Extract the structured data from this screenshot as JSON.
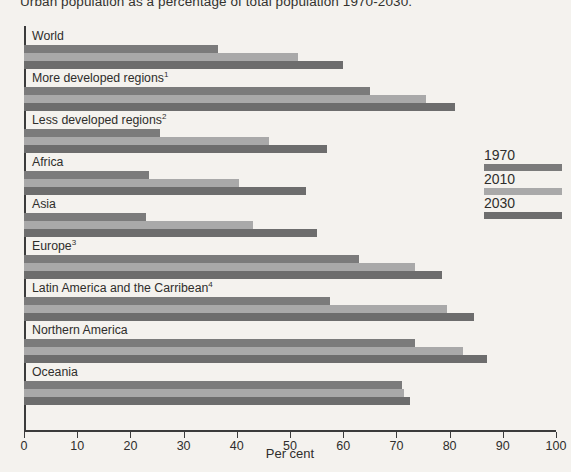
{
  "chart_data": {
    "type": "bar",
    "orientation": "horizontal",
    "title": "Urban population as a percentage of total population 1970-2030.",
    "xlabel": "Per cent",
    "ylabel": "",
    "xlim": [
      0,
      100
    ],
    "xticks": [
      0,
      10,
      20,
      30,
      40,
      50,
      60,
      70,
      80,
      90,
      100
    ],
    "grid": false,
    "legend_position": "right",
    "categories": [
      "World",
      "More developed regions",
      "Less developed regions",
      "Africa",
      "Asia",
      "Europe",
      "Latin America and the Carribean",
      "Northern America",
      "Oceania"
    ],
    "category_footnotes": [
      "",
      "1",
      "2",
      "",
      "",
      "3",
      "4",
      "",
      ""
    ],
    "series": [
      {
        "name": "1970",
        "color": "#7b7b7b",
        "values": [
          36.5,
          65,
          25.5,
          23.5,
          23,
          63,
          57.5,
          73.5,
          71
        ]
      },
      {
        "name": "2010",
        "color": "#a9a9a9",
        "values": [
          51.5,
          75.5,
          46,
          40.5,
          43,
          73.5,
          79.5,
          82.5,
          71.5
        ]
      },
      {
        "name": "2030",
        "color": "#6d6d6d",
        "values": [
          60,
          81,
          57,
          53,
          55,
          78.5,
          84.5,
          87,
          72.5
        ]
      }
    ]
  },
  "legend": {
    "entries": [
      {
        "label": "1970",
        "color": "#7b7b7b"
      },
      {
        "label": "2010",
        "color": "#a9a9a9"
      },
      {
        "label": "2030",
        "color": "#6d6d6d"
      }
    ]
  }
}
